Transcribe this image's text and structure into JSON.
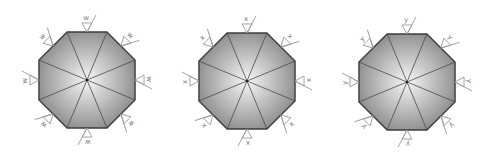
{
  "diagram": {
    "title": "",
    "figures": [
      {
        "id": "octagon-w",
        "center": [
          87,
          80
        ],
        "radius": 52,
        "symbol_letter": "w",
        "rotation_deg": 0
      },
      {
        "id": "octagon-x",
        "center": [
          247,
          81
        ],
        "radius": 52,
        "symbol_letter": "x",
        "rotation_deg": 0
      },
      {
        "id": "octagon-y",
        "center": [
          407,
          82
        ],
        "radius": 52,
        "symbol_letter": "y",
        "rotation_deg": 0
      }
    ],
    "symbols_per_side": 8,
    "symbol_type": "surface-finish-triangle",
    "colors": {
      "fill_center": "#f6f6f6",
      "fill_edge": "#8a8a8a",
      "outline": "#3c3c3c",
      "spokes": "#4a4a4a",
      "symbol_stroke": "#9a9a9a",
      "symbol_text": "#7a7a7a",
      "background": "#ffffff"
    }
  }
}
